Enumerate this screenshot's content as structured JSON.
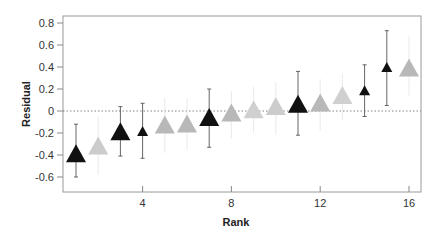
{
  "chart_data": {
    "type": "scatter",
    "title": "",
    "xlabel": "Rank",
    "ylabel": "Residual",
    "xlim": [
      0.3,
      16.5
    ],
    "ylim": [
      -0.74,
      0.86
    ],
    "xticks": [
      4,
      8,
      12,
      16
    ],
    "yticks": [
      0.8,
      0.6,
      0.4,
      0.2,
      0,
      -0.2,
      -0.4,
      -0.6
    ],
    "ytick_labels": [
      "0.8",
      "0.6",
      "0.4",
      "0.2",
      "0",
      "-0.2",
      "-0.4",
      "-0.6"
    ],
    "reference_line": {
      "y": 0,
      "style": "dotted"
    },
    "grid": false,
    "legend": null,
    "marker": "triangle-up",
    "points": [
      {
        "rank": 1,
        "residual": -0.4,
        "color": "#111111",
        "size": "large",
        "err_low": -0.6,
        "err_high": -0.12
      },
      {
        "rank": 2,
        "residual": -0.33,
        "color": "#cccccc",
        "size": "large",
        "err_low": -0.58,
        "err_high": -0.05
      },
      {
        "rank": 3,
        "residual": -0.2,
        "color": "#111111",
        "size": "large",
        "err_low": -0.41,
        "err_high": 0.04
      },
      {
        "rank": 4,
        "residual": -0.19,
        "color": "#111111",
        "size": "small",
        "err_low": -0.43,
        "err_high": 0.07
      },
      {
        "rank": 5,
        "residual": -0.14,
        "color": "#b8b8b8",
        "size": "large",
        "err_low": -0.38,
        "err_high": 0.12
      },
      {
        "rank": 6,
        "residual": -0.13,
        "color": "#b8b8b8",
        "size": "large",
        "err_low": -0.36,
        "err_high": 0.12
      },
      {
        "rank": 7,
        "residual": -0.07,
        "color": "#111111",
        "size": "large",
        "err_low": -0.33,
        "err_high": 0.2
      },
      {
        "rank": 8,
        "residual": -0.03,
        "color": "#b8b8b8",
        "size": "large",
        "err_low": -0.25,
        "err_high": 0.18
      },
      {
        "rank": 9,
        "residual": 0.0,
        "color": "#d0d0d0",
        "size": "large",
        "err_low": -0.2,
        "err_high": 0.22
      },
      {
        "rank": 10,
        "residual": 0.03,
        "color": "#cccccc",
        "size": "large",
        "err_low": -0.22,
        "err_high": 0.26
      },
      {
        "rank": 11,
        "residual": 0.05,
        "color": "#111111",
        "size": "large",
        "err_low": -0.22,
        "err_high": 0.36
      },
      {
        "rank": 12,
        "residual": 0.06,
        "color": "#b8b8b8",
        "size": "large",
        "err_low": -0.18,
        "err_high": 0.29
      },
      {
        "rank": 13,
        "residual": 0.13,
        "color": "#d0d0d0",
        "size": "large",
        "err_low": -0.08,
        "err_high": 0.34
      },
      {
        "rank": 14,
        "residual": 0.18,
        "color": "#111111",
        "size": "small",
        "err_low": -0.05,
        "err_high": 0.42
      },
      {
        "rank": 15,
        "residual": 0.39,
        "color": "#111111",
        "size": "small",
        "err_low": 0.05,
        "err_high": 0.73
      },
      {
        "rank": 16,
        "residual": 0.38,
        "color": "#b8b8b8",
        "size": "large",
        "err_low": 0.14,
        "err_high": 0.68
      }
    ]
  }
}
